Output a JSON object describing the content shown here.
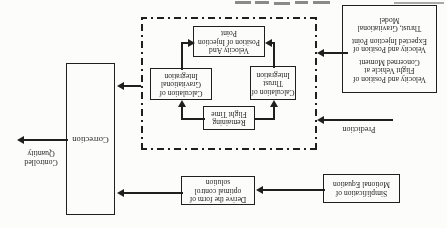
{
  "colors": {
    "ink": "#1f1f1f",
    "paper": "#fcfcfb"
  },
  "diagram": {
    "boxes": {
      "simplification": {
        "line1": "Simplification of",
        "line2": "Motional Equation"
      },
      "derive": {
        "line1": "Derive the form of",
        "line2": "optimal control",
        "line3": "solution"
      },
      "correction": {
        "label": "Correction"
      },
      "inputs": {
        "line1": "Velocity and Position of",
        "line2": "Flight Vehicle at",
        "line3": "Concerned Moment",
        "line4": "Velocity and Position of",
        "line5": "Expected Injection Point",
        "line6": "Thrust, Gravitational",
        "line7": "Model"
      },
      "remaining": {
        "line1": "Remaining",
        "line2": "Flight Time"
      },
      "thrust": {
        "line1": "Calculation of",
        "line2": "Thrust",
        "line3": "Integration"
      },
      "gravitational": {
        "line1": "Calculation of",
        "line2": "Gravitational",
        "line3": "Integration"
      },
      "injection": {
        "line1": "Velocity And",
        "line2": "Position of Injection",
        "line3": "Point"
      }
    },
    "labels": {
      "prediction": "Prediction",
      "controlled_quantity_line1": "Controlled",
      "controlled_quantity_line2": "Quantity"
    }
  }
}
